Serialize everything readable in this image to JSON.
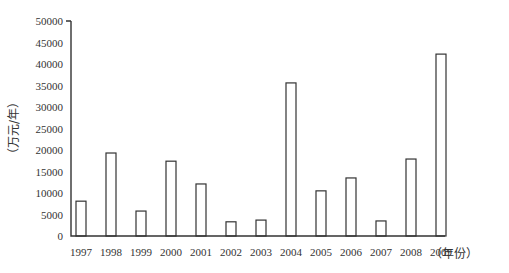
{
  "chart_data": {
    "type": "bar",
    "title": "",
    "xlabel": "（年份）",
    "ylabel": "（万元/年）",
    "categories": [
      "1997",
      "1998",
      "1999",
      "2000",
      "2001",
      "2002",
      "2003",
      "2004",
      "2005",
      "2006",
      "2007",
      "2008",
      "2009"
    ],
    "values": [
      8100,
      19300,
      5800,
      17400,
      12100,
      3300,
      3700,
      35600,
      10500,
      13500,
      3500,
      17900,
      42300
    ],
    "ylim": [
      0,
      50000
    ],
    "yticks": [
      0,
      5000,
      10000,
      15000,
      20000,
      25000,
      30000,
      35000,
      40000,
      45000,
      50000
    ],
    "grid": false,
    "legend": null,
    "bar_fill": "#ffffff",
    "bar_stroke": "#333333"
  }
}
